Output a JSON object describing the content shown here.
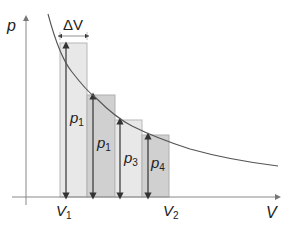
{
  "diagram": {
    "type": "pV rectangle approximation",
    "axes": {
      "y_label": "p",
      "x_label": "V"
    },
    "interval_label": "ΔV",
    "bounds": [
      {
        "base": "V",
        "sub": "1"
      },
      {
        "base": "V",
        "sub": "2"
      }
    ],
    "bars": [
      {
        "label_base": "p",
        "label_sub": "1",
        "fill": "#e6e6e6"
      },
      {
        "label_base": "p",
        "label_sub": "1",
        "fill": "#cfcfcf"
      },
      {
        "label_base": "p",
        "label_sub": "3",
        "fill": "#e6e6e6"
      },
      {
        "label_base": "p",
        "label_sub": "4",
        "fill": "#cfcfcf"
      }
    ],
    "colors": {
      "axis": "#8a8a8a",
      "curve": "#555555",
      "arrow": "#333333",
      "bar_border": "#b5b5b5"
    }
  }
}
